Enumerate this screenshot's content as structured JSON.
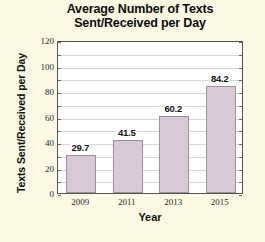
{
  "chart_data": {
    "type": "bar",
    "title": "Average Number of Texts Sent/Received per Day",
    "title_lines": [
      "Average Number of Texts",
      "Sent/Received per Day"
    ],
    "xlabel": "Year",
    "ylabel": "Texts Sent/Received per Day",
    "categories": [
      "2009",
      "2011",
      "2013",
      "2015"
    ],
    "values": [
      29.7,
      41.5,
      60.2,
      84.2
    ],
    "value_labels": [
      "29.7",
      "41.5",
      "60.2",
      "84.2"
    ],
    "ylim": [
      0,
      120
    ],
    "ytick_values": [
      0,
      20,
      40,
      60,
      80,
      100,
      120
    ],
    "ytick_labels": [
      "0",
      "20",
      "40",
      "60",
      "80",
      "100",
      "120"
    ],
    "gridline_step": 10,
    "grid": true,
    "legend": "none",
    "bar_color": "#d9c9d6",
    "bar_border_color": "#9b9296",
    "plot_background": "#ffffff",
    "figure_background": "#fbf8e3",
    "grid_color": "#d8d8d8",
    "axis_color": "#55534d"
  }
}
